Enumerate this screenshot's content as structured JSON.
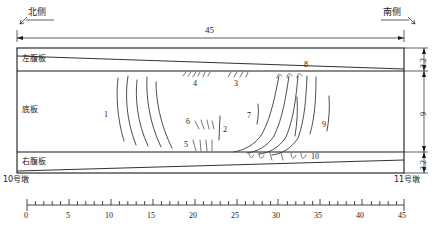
{
  "diagram": {
    "title_north": "北侧",
    "title_south": "南侧",
    "span_label": "45",
    "pier_left": "10号墩",
    "pier_right": "11号墩",
    "regions": [
      {
        "key": "left_web",
        "label": "左腹板"
      },
      {
        "key": "bottom_slab",
        "label": "底板"
      },
      {
        "key": "right_web",
        "label": "右腹板"
      }
    ],
    "vertical_dims": [
      {
        "key": "top_web_height",
        "value": "2.2"
      },
      {
        "key": "slab_width",
        "value": "9"
      },
      {
        "key": "bottom_web_height",
        "value": "2.2"
      }
    ],
    "crack_labels": [
      {
        "id": "1",
        "x": 108,
        "y": 116
      },
      {
        "id": "2",
        "x": 225,
        "y": 131
      },
      {
        "id": "3",
        "x": 237,
        "y": 85
      },
      {
        "id": "4",
        "x": 196,
        "y": 85
      },
      {
        "id": "5",
        "x": 185,
        "y": 148
      },
      {
        "id": "6",
        "x": 187,
        "y": 124
      },
      {
        "id": "7",
        "x": 250,
        "y": 116
      },
      {
        "id": "8",
        "x": 301,
        "y": 67
      },
      {
        "id": "9",
        "x": 324,
        "y": 127
      },
      {
        "id": "10",
        "x": 315,
        "y": 158
      }
    ],
    "axis": {
      "min": 0,
      "max": 45,
      "major_step": 5,
      "minor_step": 1,
      "ticks": [
        "0",
        "5",
        "10",
        "15",
        "20",
        "25",
        "30",
        "35",
        "40",
        "45"
      ]
    },
    "colors": {
      "ink": "#1a1a1a",
      "crack": "#3a3a3a",
      "background": "#ffffff"
    }
  }
}
